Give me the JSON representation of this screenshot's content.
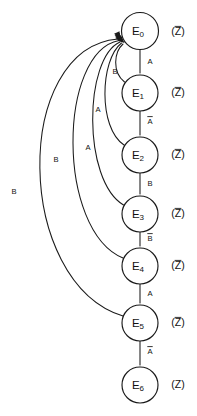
{
  "diagram": {
    "type": "state-machine",
    "width": 197,
    "height": 416,
    "background_color": "#ffffff",
    "line_color": "#1a1a1a"
  },
  "states": [
    {
      "id": "E0",
      "name": "E",
      "subscript": "0",
      "cx": 140,
      "cy": 31,
      "r": 18.5,
      "output": "(Z)",
      "output_overbar": true,
      "output_x": 178,
      "output_y": 32
    },
    {
      "id": "E1",
      "name": "E",
      "subscript": "1",
      "cx": 140,
      "cy": 93,
      "r": 18.0,
      "output": "(Z)",
      "output_overbar": true,
      "output_x": 178,
      "output_y": 93
    },
    {
      "id": "E2",
      "name": "E",
      "subscript": "2",
      "cx": 140,
      "cy": 155,
      "r": 18.0,
      "output": "(Z)",
      "output_overbar": true,
      "output_x": 178,
      "output_y": 155
    },
    {
      "id": "E3",
      "name": "E",
      "subscript": "3",
      "cx": 140,
      "cy": 214,
      "r": 18.0,
      "output": "(Z)",
      "output_overbar": true,
      "output_x": 178,
      "output_y": 214
    },
    {
      "id": "E4",
      "name": "E",
      "subscript": "4",
      "cx": 140,
      "cy": 266,
      "r": 18.0,
      "output": "(Z)",
      "output_overbar": true,
      "output_x": 178,
      "output_y": 266
    },
    {
      "id": "E5",
      "name": "E",
      "subscript": "5",
      "cx": 140,
      "cy": 323,
      "r": 18.0,
      "output": "(Z)",
      "output_overbar": true,
      "output_x": 178,
      "output_y": 323
    },
    {
      "id": "E6",
      "name": "E",
      "subscript": "6",
      "cx": 140,
      "cy": 385,
      "r": 18.0,
      "output": "(Z)",
      "output_overbar": false,
      "output_x": 178,
      "output_y": 385
    }
  ],
  "forward_transitions": [
    {
      "from": "E0",
      "to": "E1",
      "label": "A",
      "overbar": false,
      "label_x": 150,
      "label_y": 62,
      "path": "M 140 49.5 L 140 73",
      "arrow_x": 140,
      "arrow_y": 74.5
    },
    {
      "from": "E1",
      "to": "E2",
      "label": "A",
      "overbar": true,
      "label_x": 150,
      "label_y": 122,
      "path": "M 140 111 L 140 135",
      "arrow_x": 140,
      "arrow_y": 136.5
    },
    {
      "from": "E2",
      "to": "E3",
      "label": "B",
      "overbar": false,
      "label_x": 150,
      "label_y": 184,
      "path": "M 140 173 L 140 194",
      "arrow_x": 140,
      "arrow_y": 195.5
    },
    {
      "from": "E3",
      "to": "E4",
      "label": "B",
      "overbar": true,
      "label_x": 150,
      "label_y": 239,
      "path": "M 140 232 L 140 246",
      "arrow_x": 140,
      "arrow_y": 247.5
    },
    {
      "from": "E4",
      "to": "E5",
      "label": "A",
      "overbar": false,
      "label_x": 150,
      "label_y": 294,
      "path": "M 140 284 L 140 303",
      "arrow_x": 140,
      "arrow_y": 304.5
    },
    {
      "from": "E5",
      "to": "E6",
      "label": "A",
      "overbar": true,
      "label_x": 150,
      "label_y": 352,
      "path": "M 140 341 L 140 365",
      "arrow_x": 140,
      "arrow_y": 366.5
    }
  ],
  "feedback_transitions": [
    {
      "from": "E1",
      "to": "E0",
      "label": "B",
      "overbar": false,
      "label_x": 115,
      "label_y": 72,
      "path": "M 124.5 82 C 112 72 114 52 123 44",
      "arrow_x": 124.5,
      "arrow_y": 43,
      "arrow_angle": -48
    },
    {
      "from": "E2",
      "to": "E0",
      "label": "A",
      "overbar": false,
      "label_x": 98,
      "label_y": 110,
      "path": "M 124 145 C 98 128 100 60 121.5 43",
      "arrow_x": 123,
      "arrow_y": 42,
      "arrow_angle": -42
    },
    {
      "from": "E3",
      "to": "E0",
      "label": "A",
      "overbar": false,
      "label_x": 88,
      "label_y": 148,
      "path": "M 123.5 205 C 82 180 84 58 120 42",
      "arrow_x": 121.5,
      "arrow_y": 41.5,
      "arrow_angle": -36
    },
    {
      "from": "E4",
      "to": "E0",
      "label": "B",
      "overbar": false,
      "label_x": 56,
      "label_y": 160,
      "path": "M 123 258 C 56 230 58 52 119 40.5",
      "arrow_x": 120.5,
      "arrow_y": 40,
      "arrow_angle": -30
    },
    {
      "from": "E5",
      "to": "E0",
      "label": "B",
      "overbar": false,
      "label_x": 14,
      "label_y": 192,
      "path": "M 123 316 C 14 282 12 48 118 39",
      "arrow_x": 119.5,
      "arrow_y": 38.5,
      "arrow_angle": -24
    }
  ]
}
